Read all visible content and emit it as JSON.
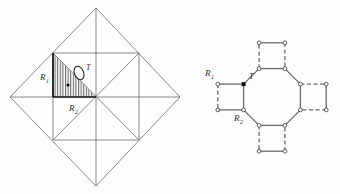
{
  "figure": {
    "background_color": "#fdfdfd",
    "line_color": "#555555",
    "hatch_color": "#3a3a3a",
    "marker_color": "#111111",
    "panels": [
      {
        "id": "left-panel",
        "name": "diamond-triangulation-panel",
        "description": "Square rotated 45 degrees with inscribed square and full triangulation; one triangle is hatched",
        "labels": {
          "region1": {
            "text": "R",
            "sub": "1",
            "x": 40,
            "y": 80
          },
          "region2": {
            "text": "R",
            "sub": "2",
            "x": 70,
            "y": 110
          },
          "tile": {
            "text": "T",
            "x": 85,
            "y": 72
          }
        },
        "geometry": {
          "diamond": [
            [
              96,
              8
            ],
            [
              180,
              97
            ],
            [
              96,
              186
            ],
            [
              10,
              97
            ]
          ],
          "inner_square": [
            [
              53,
              53
            ],
            [
              139,
              53
            ],
            [
              139,
              140
            ],
            [
              53,
              140
            ]
          ],
          "hatched_triangle": [
            [
              53,
              53
            ],
            [
              96,
              97
            ],
            [
              53,
              97
            ]
          ],
          "dot": [
            68,
            85
          ],
          "ellipse": {
            "cx": 79,
            "cy": 73,
            "rx": 5,
            "ry": 7,
            "rotate": -22
          }
        }
      },
      {
        "id": "right-panel",
        "name": "octagon-squares-panel",
        "description": "Central octagon surrounded by four squares attached at alternating edges; square sides drawn dashed, octagon sides solid, vertices as small circles",
        "labels": {
          "region1": {
            "text": "R",
            "sub": "1",
            "x": 208,
            "y": 73
          },
          "region2": {
            "text": "R",
            "sub": "2",
            "x": 238,
            "y": 122
          },
          "tile": {
            "text": "T",
            "x": 250,
            "y": 79
          }
        },
        "geometry": {
          "octagon_center": [
            272,
            97
          ],
          "octagon_radius": 31,
          "square_side": 34
        }
      }
    ]
  }
}
